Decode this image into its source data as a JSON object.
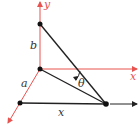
{
  "colors": {
    "axis": "#e8524f",
    "line": "#222222",
    "point": "#111111",
    "label_black": "#333333",
    "label_red": "#e8524f"
  },
  "labels": {
    "y_axis": "y",
    "x_axis": "x",
    "b": "b",
    "a": "a",
    "x_base": "x",
    "theta": "θ"
  }
}
